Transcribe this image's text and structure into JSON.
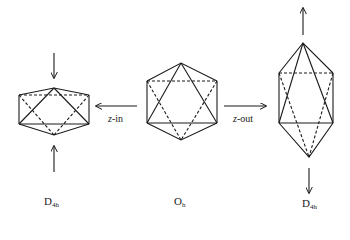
{
  "figure": {
    "stroke_color": "#1a1a1a",
    "background": "#ffffff",
    "shapes": [
      {
        "id": "left",
        "geometry": "compressed-octahedron",
        "label_main": "D",
        "label_sub": "4h"
      },
      {
        "id": "center",
        "geometry": "octahedron",
        "label_main": "O",
        "label_sub": "h"
      },
      {
        "id": "right",
        "geometry": "elongated-octahedron",
        "label_main": "D",
        "label_sub": "4h"
      }
    ],
    "transitions": [
      {
        "from": "center",
        "to": "left",
        "label_axis": "z",
        "label_suffix": "-in"
      },
      {
        "from": "center",
        "to": "right",
        "label_axis": "z",
        "label_suffix": "-out"
      }
    ]
  }
}
